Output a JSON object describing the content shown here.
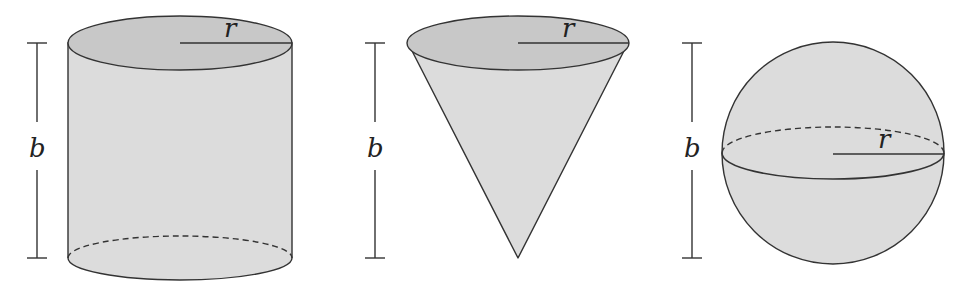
{
  "figure": {
    "shapes": [
      {
        "name": "cylinder",
        "height_label": "b",
        "radius_label": "r"
      },
      {
        "name": "cone",
        "height_label": "b",
        "radius_label": "r"
      },
      {
        "name": "sphere",
        "height_label": "b",
        "radius_label": "r"
      }
    ],
    "colors": {
      "fill_side": "#dcdcdc",
      "fill_top": "#c8c8c8",
      "stroke": "#333333"
    }
  }
}
